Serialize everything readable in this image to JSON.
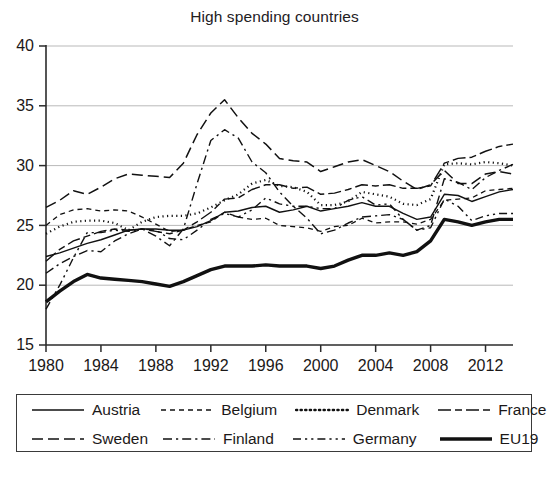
{
  "chart_data": {
    "type": "line",
    "title": "High spending countries",
    "xlabel": "",
    "ylabel": "",
    "xlim": [
      1980,
      2014
    ],
    "ylim": [
      15,
      40
    ],
    "ytick_labels": [
      "15",
      "20",
      "25",
      "30",
      "35",
      "40"
    ],
    "yticks": [
      15,
      20,
      25,
      30,
      35,
      40
    ],
    "xtick_labels": [
      "1980",
      "1984",
      "1988",
      "1992",
      "1996",
      "2000",
      "2004",
      "2008",
      "2012"
    ],
    "xticks": [
      1980,
      1984,
      1988,
      1992,
      1996,
      2000,
      2004,
      2008,
      2012
    ],
    "grid": "horizontal",
    "legend_position": "below-axes",
    "x": [
      1980,
      1981,
      1982,
      1983,
      1984,
      1985,
      1986,
      1987,
      1988,
      1989,
      1990,
      1991,
      1992,
      1993,
      1994,
      1995,
      1996,
      1997,
      1998,
      1999,
      2000,
      2001,
      2002,
      2003,
      2004,
      2005,
      2006,
      2007,
      2008,
      2009,
      2010,
      2011,
      2012,
      2013,
      2014
    ],
    "series": [
      {
        "name": "Austria",
        "dash": "solid",
        "width": 1.4,
        "values": [
          22.4,
          22.7,
          23.1,
          23.5,
          23.8,
          24.2,
          24.6,
          24.7,
          24.7,
          24.6,
          24.6,
          24.9,
          25.4,
          26.1,
          26.2,
          26.5,
          26.6,
          26.1,
          26.3,
          26.6,
          26.2,
          26.4,
          26.6,
          26.9,
          26.6,
          26.6,
          26.0,
          25.5,
          25.7,
          27.6,
          27.5,
          27.0,
          27.4,
          27.8,
          28.0
        ]
      },
      {
        "name": "Belgium",
        "dash": "short-dash",
        "width": 1.3,
        "values": [
          25.0,
          25.9,
          26.3,
          26.4,
          26.2,
          26.3,
          26.2,
          25.7,
          25.1,
          24.5,
          24.6,
          25.0,
          25.3,
          26.1,
          25.7,
          25.5,
          25.6,
          25.0,
          24.9,
          24.8,
          24.5,
          24.9,
          25.0,
          25.6,
          25.2,
          25.3,
          25.3,
          25.1,
          25.5,
          27.1,
          27.2,
          27.3,
          27.9,
          28.0,
          28.1
        ]
      },
      {
        "name": "Denmark",
        "dash": "dotted",
        "width": 2.2,
        "values": [
          24.3,
          24.9,
          25.3,
          25.4,
          25.4,
          25.2,
          24.6,
          25.3,
          25.7,
          25.8,
          25.8,
          26.0,
          26.5,
          27.1,
          27.6,
          28.5,
          28.8,
          28.3,
          28.2,
          27.8,
          26.7,
          26.7,
          27.0,
          27.8,
          27.6,
          27.4,
          26.8,
          26.7,
          27.2,
          30.1,
          30.2,
          30.1,
          30.3,
          30.2,
          30.0
        ]
      },
      {
        "name": "France",
        "dash": "long-dash-dot",
        "width": 1.4,
        "values": [
          22.0,
          23.0,
          23.7,
          24.1,
          24.5,
          24.7,
          24.6,
          24.7,
          24.5,
          24.3,
          24.6,
          25.3,
          26.1,
          27.2,
          27.3,
          28.0,
          28.4,
          28.4,
          28.1,
          28.2,
          27.6,
          27.7,
          28.0,
          28.4,
          28.3,
          28.4,
          28.1,
          28.1,
          28.3,
          30.2,
          30.6,
          30.7,
          31.2,
          31.6,
          31.8
        ]
      },
      {
        "name": "Sweden",
        "dash": "long-dash",
        "width": 1.5,
        "values": [
          26.5,
          27.1,
          27.9,
          27.6,
          28.2,
          28.9,
          29.3,
          29.2,
          29.1,
          29.0,
          30.2,
          32.6,
          34.4,
          35.5,
          34.0,
          32.7,
          31.8,
          30.6,
          30.4,
          30.3,
          29.5,
          29.9,
          30.3,
          30.5,
          30.0,
          29.5,
          28.7,
          28.0,
          28.4,
          29.6,
          28.5,
          28.5,
          29.3,
          29.5,
          29.3
        ]
      },
      {
        "name": "Finland",
        "dash": "dash-dot",
        "width": 1.4,
        "values": [
          21.0,
          21.8,
          22.4,
          22.9,
          22.8,
          23.7,
          24.3,
          24.7,
          24.1,
          23.3,
          24.7,
          28.5,
          32.1,
          33.0,
          32.3,
          30.3,
          29.4,
          27.8,
          26.6,
          25.6,
          24.3,
          24.6,
          25.2,
          25.7,
          25.8,
          25.9,
          25.5,
          24.6,
          25.0,
          28.9,
          28.6,
          28.0,
          29.0,
          29.6,
          30.1
        ]
      },
      {
        "name": "Germany",
        "dash": "dash-dot-dot",
        "width": 1.4,
        "values": [
          18.0,
          20.0,
          22.3,
          24.4,
          24.4,
          24.6,
          24.5,
          24.7,
          24.6,
          23.9,
          23.8,
          24.6,
          25.5,
          26.0,
          25.7,
          26.3,
          27.3,
          26.8,
          26.6,
          26.6,
          26.4,
          26.4,
          27.1,
          27.4,
          26.7,
          26.8,
          25.5,
          24.6,
          24.8,
          27.2,
          26.6,
          25.4,
          25.8,
          26.0,
          26.0
        ]
      },
      {
        "name": "EU19",
        "dash": "solid",
        "width": 3.4,
        "values": [
          18.6,
          19.5,
          20.3,
          20.9,
          20.6,
          20.5,
          20.4,
          20.3,
          20.1,
          19.9,
          20.3,
          20.8,
          21.3,
          21.6,
          21.6,
          21.6,
          21.7,
          21.6,
          21.6,
          21.6,
          21.4,
          21.6,
          22.1,
          22.5,
          22.5,
          22.7,
          22.5,
          22.8,
          23.7,
          25.5,
          25.3,
          25.0,
          25.3,
          25.5,
          25.5
        ]
      }
    ]
  },
  "legend": {
    "rows": [
      [
        {
          "label": "Austria",
          "dash": "solid",
          "width": 1.6
        },
        {
          "label": "Belgium",
          "dash": "short-dash",
          "width": 1.5
        },
        {
          "label": "Denmark",
          "dash": "dotted",
          "width": 2.4
        },
        {
          "label": "France",
          "dash": "long-dash-dot",
          "width": 1.6
        }
      ],
      [
        {
          "label": "Sweden",
          "dash": "long-dash",
          "width": 1.6
        },
        {
          "label": "Finland",
          "dash": "dash-dot",
          "width": 1.6
        },
        {
          "label": "Germany",
          "dash": "dash-dot-dot",
          "width": 1.6
        },
        {
          "label": "EU19",
          "dash": "solid",
          "width": 3.6
        }
      ]
    ]
  }
}
